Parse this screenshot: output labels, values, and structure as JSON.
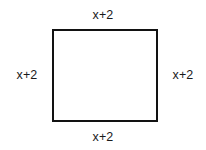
{
  "figure": {
    "name": "square-with-side-labels",
    "shape": {
      "type": "square",
      "stroke_color": "#121212",
      "fill_color": "#ffffff",
      "stroke_width_px": 2
    },
    "background_color": "#ffffff",
    "text_color": "#1a1a1a",
    "labels": {
      "top": "x+2",
      "right": "x+2",
      "bottom": "x+2",
      "left": "x+2"
    }
  }
}
